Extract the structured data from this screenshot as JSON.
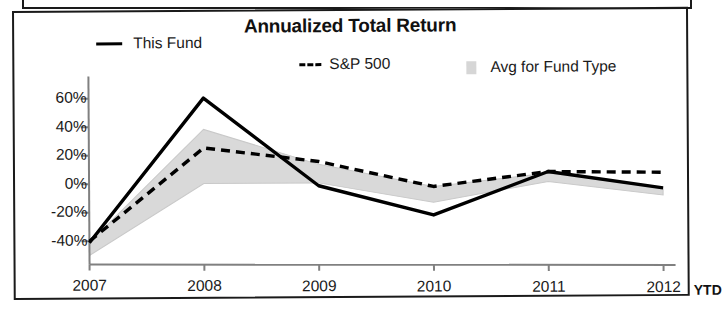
{
  "chart_data": {
    "type": "line",
    "title": "Annualized Total Return",
    "xlabel": "",
    "ylabel": "",
    "categories": [
      "2007",
      "2008",
      "2009",
      "2010",
      "2011",
      "2012"
    ],
    "x_axis_note": "YTD",
    "ylim": [
      -50,
      70
    ],
    "yticks": [
      60,
      40,
      20,
      0,
      -20,
      -40
    ],
    "ytick_labels": [
      "60%",
      "40%",
      "20%",
      "0%",
      "-20%",
      "-40%"
    ],
    "grid": false,
    "legend_position": "top",
    "series": [
      {
        "name": "This Fund",
        "style": "solid",
        "color": "#000000",
        "values": [
          -41,
          60,
          -2,
          -23,
          7,
          -5
        ]
      },
      {
        "name": "S&P 500",
        "style": "dashed",
        "color": "#000000",
        "values": [
          -40,
          25,
          15,
          -3,
          7,
          6
        ]
      },
      {
        "name": "Avg for Fund Type",
        "style": "area",
        "color": "#d9d9d9",
        "values": [
          -41,
          38,
          13,
          -12,
          4,
          -9
        ],
        "band_note": "shaded band between fund-type average and the zero / fund line"
      }
    ],
    "band": {
      "name": "Avg for Fund Type",
      "upper": [
        -41,
        38,
        13,
        -3,
        6,
        -5
      ],
      "lower": [
        -50,
        0,
        0,
        -14,
        0,
        -10
      ]
    }
  },
  "legend": {
    "items": [
      {
        "label": "This Fund",
        "marker": "solid-line"
      },
      {
        "label": "S&P 500",
        "marker": "dashed-line"
      },
      {
        "label": "Avg for Fund Type",
        "marker": "gray-swatch"
      }
    ]
  },
  "axis": {
    "y_labels": [
      "60%",
      "40%",
      "20%",
      "0%",
      "-20%",
      "-40%"
    ],
    "x_labels": [
      "2007",
      "2008",
      "2009",
      "2010",
      "2011",
      "2012"
    ],
    "x_suffix": "YTD"
  },
  "colors": {
    "line": "#000000",
    "band": "#d9d9d9",
    "axis": "#808080",
    "border": "#1a1a1a",
    "text": "#111111"
  }
}
